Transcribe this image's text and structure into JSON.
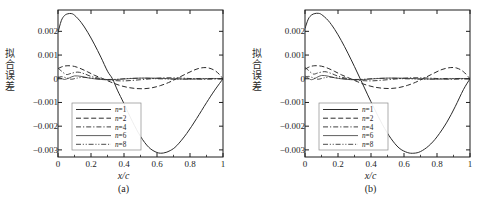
{
  "figure": {
    "panels": [
      {
        "id": "a",
        "caption": "(a)",
        "xlabel": "x/c",
        "ylabel_chars": [
          "拟",
          "合",
          "误",
          "差"
        ],
        "ylabel": "拟合误差"
      },
      {
        "id": "b",
        "caption": "(b)",
        "xlabel": "x/c",
        "ylabel_chars": [
          "拟",
          "合",
          "误",
          "差"
        ],
        "ylabel": "拟合误差"
      }
    ],
    "colors": {
      "axis": "#1d1d1d",
      "curve": "#2a2a2a",
      "background": "#ffffff",
      "legend_border": "#8a8a8a"
    }
  },
  "chart_data": [
    {
      "type": "line",
      "panel": "a",
      "title": "",
      "xlabel": "x/c",
      "ylabel": "拟合误差",
      "xlim": [
        0,
        1
      ],
      "ylim": [
        -0.0033,
        0.0029
      ],
      "xticks": [
        0,
        0.2,
        0.4,
        0.6,
        0.8,
        1
      ],
      "xticklabels": [
        "0",
        "0.2",
        "0.4",
        "0.6",
        "0.8",
        "1"
      ],
      "yticks": [
        0.002,
        0.001,
        0,
        -0.001,
        -0.002,
        -0.003
      ],
      "yticklabels": [
        "0.002",
        "0.001",
        "0",
        "-0.001",
        "-0.002",
        "-0.003"
      ],
      "grid": false,
      "legend_position": "lower-left",
      "minor_xticks": true,
      "series": [
        {
          "name": "n=1",
          "style": "solid",
          "x": [
            0,
            0.02,
            0.04,
            0.06,
            0.08,
            0.1,
            0.14,
            0.18,
            0.22,
            0.26,
            0.3,
            0.33,
            0.36,
            0.4,
            0.45,
            0.5,
            0.55,
            0.6,
            0.64,
            0.68,
            0.72,
            0.78,
            0.84,
            0.9,
            0.95,
            1
          ],
          "y": [
            0.00195,
            0.00245,
            0.00267,
            0.00274,
            0.00275,
            0.00268,
            0.00238,
            0.00196,
            0.00146,
            0.00091,
            0.00032,
            0,
            -0.00048,
            -0.00105,
            -0.00179,
            -0.00243,
            -0.00289,
            -0.00311,
            -0.00313,
            -0.00303,
            -0.00282,
            -0.00231,
            -0.00168,
            -0.00101,
            -0.00048,
            0
          ]
        },
        {
          "name": "n=2",
          "style": "dashed",
          "x": [
            0,
            0.03,
            0.06,
            0.1,
            0.14,
            0.18,
            0.22,
            0.27,
            0.32,
            0.37,
            0.42,
            0.47,
            0.52,
            0.57,
            0.62,
            0.67,
            0.72,
            0.78,
            0.83,
            0.87,
            0.91,
            0.95,
            0.98,
            1
          ],
          "y": [
            0.00043,
            0.00052,
            0.00055,
            0.00052,
            0.00042,
            0.00029,
            0.00015,
            1e-05,
            -0.00014,
            -0.00027,
            -0.00036,
            -0.00041,
            -0.00042,
            -0.00038,
            -0.00029,
            -0.00016,
            1e-05,
            0.00022,
            0.00038,
            0.00046,
            0.00046,
            0.00035,
            0.00017,
            0
          ]
        },
        {
          "name": "n=4",
          "style": "dashdot",
          "x": [
            0,
            0.02,
            0.05,
            0.08,
            0.12,
            0.16,
            0.2,
            0.25,
            0.3,
            0.35,
            0.4,
            0.45,
            0.5,
            0.55,
            0.6,
            0.65,
            0.7,
            0.75,
            0.8,
            0.85,
            0.9,
            0.95,
            1
          ],
          "y": [
            0.00045,
            0.00033,
            0.00018,
            0.00023,
            0.00028,
            0.00021,
            0.0001,
            2e-05,
            -4e-05,
            -8e-05,
            -9e-05,
            -7e-05,
            -4e-05,
            -1e-05,
            2e-05,
            4e-05,
            4e-05,
            3e-05,
            1e-05,
            -1e-05,
            -2e-05,
            -1e-05,
            0
          ]
        },
        {
          "name": "n=6",
          "style": "solid-thin",
          "x": [
            0,
            0.02,
            0.04,
            0.07,
            0.1,
            0.14,
            0.18,
            0.23,
            0.28,
            0.33,
            0.38,
            0.44,
            0.5,
            0.56,
            0.62,
            0.68,
            0.74,
            0.8,
            0.86,
            0.92,
            0.96,
            1
          ],
          "y": [
            8e-05,
            2e-05,
            -3e-05,
            4e-05,
            0.00012,
            0.0001,
            4e-05,
            -1e-05,
            -4e-05,
            -4e-05,
            -2e-05,
            1e-05,
            3e-05,
            3e-05,
            2e-05,
            0,
            -1e-05,
            -2e-05,
            -1e-05,
            1e-05,
            1e-05,
            0
          ]
        },
        {
          "name": "n=8",
          "style": "dashdotdot",
          "x": [
            0,
            0.02,
            0.05,
            0.08,
            0.11,
            0.15,
            0.2,
            0.25,
            0.3,
            0.36,
            0.42,
            0.48,
            0.54,
            0.6,
            0.66,
            0.72,
            0.78,
            0.84,
            0.9,
            0.95,
            1
          ],
          "y": [
            4e-05,
            9e-05,
            4e-05,
            -2e-05,
            2e-05,
            6e-05,
            3e-05,
            -1e-05,
            -3e-05,
            -2e-05,
            1e-05,
            2e-05,
            2e-05,
            0,
            -1e-05,
            -2e-05,
            -1e-05,
            1e-05,
            1e-05,
            0,
            0
          ]
        }
      ],
      "legend": [
        "n=1",
        "n=2",
        "n=4",
        "n=6",
        "n=8"
      ]
    },
    {
      "type": "line",
      "panel": "b",
      "title": "",
      "xlabel": "x/c",
      "ylabel": "拟合误差",
      "xlim": [
        0,
        1
      ],
      "ylim": [
        -0.0033,
        0.0029
      ],
      "xticks": [
        0,
        0.2,
        0.4,
        0.6,
        0.8,
        1
      ],
      "xticklabels": [
        "0",
        "0.2",
        "0.4",
        "0.6",
        "0.8",
        "1"
      ],
      "yticks": [
        0.002,
        0.001,
        0,
        -0.001,
        -0.002,
        -0.003
      ],
      "yticklabels": [
        "0.002",
        "0.001",
        "0",
        "-0.001",
        "-0.002",
        "-0.003"
      ],
      "grid": false,
      "legend_position": "lower-left",
      "minor_xticks": true,
      "series": [
        {
          "name": "n=1",
          "style": "solid",
          "x": [
            0,
            0.02,
            0.04,
            0.06,
            0.08,
            0.1,
            0.14,
            0.18,
            0.22,
            0.26,
            0.3,
            0.34,
            0.38,
            0.42,
            0.47,
            0.52,
            0.57,
            0.62,
            0.66,
            0.7,
            0.75,
            0.8,
            0.86,
            0.91,
            0.96,
            1
          ],
          "y": [
            0.00212,
            0.00252,
            0.00269,
            0.00275,
            0.00276,
            0.00271,
            0.00246,
            0.00208,
            0.00161,
            0.00108,
            0.00051,
            -8e-05,
            -0.00068,
            -0.00126,
            -0.00194,
            -0.00251,
            -0.00292,
            -0.00311,
            -0.00314,
            -0.00307,
            -0.00283,
            -0.00245,
            -0.00183,
            -0.00118,
            -0.00046,
            0
          ]
        },
        {
          "name": "n=2",
          "style": "dashed",
          "x": [
            0,
            0.03,
            0.06,
            0.1,
            0.14,
            0.18,
            0.22,
            0.27,
            0.32,
            0.37,
            0.42,
            0.47,
            0.52,
            0.57,
            0.62,
            0.67,
            0.72,
            0.78,
            0.83,
            0.88,
            0.92,
            0.96,
            1
          ],
          "y": [
            0.0004,
            0.00051,
            0.00055,
            0.00053,
            0.00044,
            0.00031,
            0.00017,
            2e-05,
            -0.00013,
            -0.00026,
            -0.00035,
            -0.0004,
            -0.00041,
            -0.00037,
            -0.00028,
            -0.00015,
            2e-05,
            0.00023,
            0.00039,
            0.00047,
            0.00045,
            0.0003,
            0
          ]
        },
        {
          "name": "n=4",
          "style": "dashdot",
          "x": [
            0,
            0.02,
            0.05,
            0.08,
            0.12,
            0.16,
            0.2,
            0.25,
            0.3,
            0.35,
            0.4,
            0.45,
            0.5,
            0.55,
            0.6,
            0.65,
            0.7,
            0.75,
            0.8,
            0.85,
            0.9,
            0.95,
            1
          ],
          "y": [
            0.00048,
            0.00036,
            0.0002,
            0.00025,
            0.0003,
            0.00022,
            0.00011,
            2e-05,
            -4e-05,
            -8e-05,
            -9e-05,
            -7e-05,
            -4e-05,
            -1e-05,
            2e-05,
            4e-05,
            4e-05,
            3e-05,
            1e-05,
            -1e-05,
            -2e-05,
            -1e-05,
            0
          ]
        },
        {
          "name": "n=6",
          "style": "solid-thin",
          "x": [
            0,
            0.02,
            0.04,
            0.07,
            0.1,
            0.14,
            0.18,
            0.23,
            0.28,
            0.33,
            0.38,
            0.44,
            0.5,
            0.56,
            0.62,
            0.68,
            0.74,
            0.8,
            0.86,
            0.92,
            0.96,
            1
          ],
          "y": [
            0.00012,
            3e-05,
            -4e-05,
            5e-05,
            0.00014,
            0.00011,
            4e-05,
            -1e-05,
            -4e-05,
            -4e-05,
            -2e-05,
            1e-05,
            3e-05,
            3e-05,
            2e-05,
            0,
            -1e-05,
            -2e-05,
            -1e-05,
            1e-05,
            1e-05,
            0
          ]
        },
        {
          "name": "n=8",
          "style": "dashdotdot",
          "x": [
            0,
            0.02,
            0.05,
            0.08,
            0.11,
            0.15,
            0.2,
            0.25,
            0.3,
            0.36,
            0.42,
            0.48,
            0.54,
            0.6,
            0.66,
            0.72,
            0.78,
            0.84,
            0.9,
            0.95,
            1
          ],
          "y": [
            5e-05,
            0.0001,
            4e-05,
            -2e-05,
            3e-05,
            7e-05,
            3e-05,
            -1e-05,
            -3e-05,
            -2e-05,
            1e-05,
            2e-05,
            2e-05,
            0,
            -1e-05,
            -2e-05,
            -1e-05,
            1e-05,
            1e-05,
            0,
            0
          ]
        }
      ],
      "legend": [
        "n=1",
        "n=2",
        "n=4",
        "n=6",
        "n=8"
      ]
    }
  ]
}
